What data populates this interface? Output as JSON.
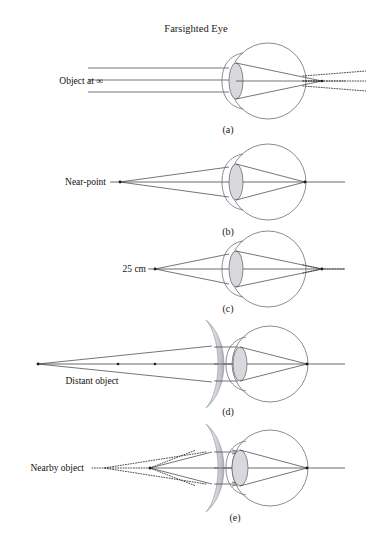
{
  "figure": {
    "title": "Farsighted Eye"
  },
  "panels": [
    {
      "id": "a",
      "label": "(a)",
      "object_label": "Object at ∞",
      "label_x": 103,
      "label_y": 80,
      "label_anchor": "end",
      "axis_y": 80,
      "eye_cx": 268,
      "eye_cy": 81,
      "eye_r": 38,
      "lens_cx": 236,
      "lens_rx": 7,
      "lens_ry": 18,
      "has_corrective_lens": false,
      "focus_behind_retina": true,
      "panel_label_x": 228,
      "panel_label_y": 133,
      "ray_type": "parallel",
      "ray_source_x": 88,
      "ray_offsets": [
        -12,
        0,
        12
      ]
    },
    {
      "id": "b",
      "label": "(b)",
      "object_label": "Near-point",
      "label_x": 106,
      "label_y": 181,
      "label_anchor": "end",
      "axis_y": 182,
      "eye_cx": 268,
      "eye_cy": 182,
      "eye_r": 38,
      "lens_cx": 236,
      "lens_rx": 7,
      "lens_ry": 18,
      "has_corrective_lens": false,
      "focus_behind_retina": false,
      "panel_label_x": 228,
      "panel_label_y": 235,
      "ray_type": "point",
      "ray_source_x": 120,
      "ray_offsets": [
        -12,
        0,
        12
      ]
    },
    {
      "id": "c",
      "label": "(c)",
      "object_label": "25 cm",
      "label_x": 147,
      "label_y": 268,
      "label_anchor": "end",
      "axis_y": 269,
      "eye_cx": 268,
      "eye_cy": 269,
      "eye_r": 38,
      "lens_cx": 236,
      "lens_rx": 7,
      "lens_ry": 18,
      "has_corrective_lens": false,
      "focus_behind_retina": true,
      "panel_label_x": 228,
      "panel_label_y": 312,
      "ray_type": "point",
      "ray_source_x": 155,
      "ray_offsets": [
        -12,
        0,
        12
      ]
    },
    {
      "id": "d",
      "label": "(d)",
      "object_label": "Distant object",
      "label_x": 92,
      "label_y": 383,
      "label_anchor": "middle",
      "axis_y": 364,
      "eye_cx": 270,
      "eye_cy": 364,
      "eye_r": 38,
      "lens_cx": 240,
      "lens_rx": 7,
      "lens_ry": 17,
      "has_corrective_lens": true,
      "corr_lens_x": 212,
      "corr_lens_top": 320,
      "corr_lens_bottom": 408,
      "focus_behind_retina": false,
      "panel_label_x": 228,
      "panel_label_y": 415,
      "ray_type": "point",
      "ray_source_x": 38,
      "ray_offsets": [
        -13,
        0,
        13
      ],
      "axis_dots": [
        38,
        118,
        155
      ]
    },
    {
      "id": "e",
      "label": "(e)",
      "object_label": "Nearby object",
      "label_x": 73,
      "label_y": 470,
      "label_anchor": "end",
      "axis_y": 468,
      "eye_cx": 270,
      "eye_cy": 468,
      "eye_r": 38,
      "lens_cx": 240,
      "lens_rx": 8,
      "lens_ry": 18,
      "has_corrective_lens": true,
      "corr_lens_x": 212,
      "corr_lens_top": 424,
      "corr_lens_bottom": 512,
      "focus_behind_retina": false,
      "panel_label_x": 235,
      "panel_label_y": 520,
      "ray_type": "point-virtual",
      "ray_source_x": 150,
      "virtual_source_x": 108,
      "ray_offsets": [
        -13,
        0,
        13
      ]
    }
  ],
  "colors": {
    "background": "#ffffff",
    "outline": "#6f6f78",
    "lens_fill": "#d7d9dc",
    "ray": "#3a3a42",
    "axis": "#2b2b2b",
    "text": "#1a1a1a"
  }
}
